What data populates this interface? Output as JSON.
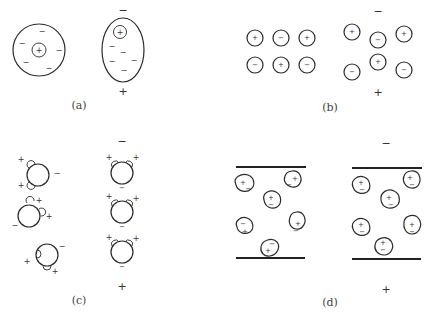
{
  "figure": {
    "panels": [
      {
        "id": "a",
        "caption": "(a)",
        "content": "atom without field: positive nucleus centered in spherical electron cloud; with field: cloud distorted, nucleus displaced toward negative side"
      },
      {
        "id": "b",
        "caption": "(b)",
        "content": "ionic lattice of alternating + and - ions; with field ions displaced"
      },
      {
        "id": "c",
        "caption": "(c)",
        "content": "polar molecules randomly oriented; with field dipoles aligned"
      },
      {
        "id": "d",
        "caption": "(d)",
        "content": "grains between electrode plates with random charges; with field charges separated"
      }
    ],
    "field": {
      "top_symbol": "−",
      "bottom_symbol": "+"
    },
    "symbols": {
      "plus": "+",
      "minus": "−"
    }
  }
}
